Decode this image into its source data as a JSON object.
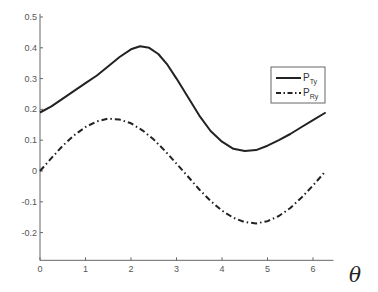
{
  "chart_data": {
    "type": "line",
    "title": "",
    "xlabel": "θ",
    "ylabel": "",
    "xlim": [
      0,
      6.45
    ],
    "ylim": [
      -0.29,
      0.51
    ],
    "xticks": [
      0,
      1,
      2,
      3,
      4,
      5,
      6
    ],
    "xtick_labels": [
      "0",
      "1",
      "2",
      "3",
      "4",
      "5",
      "6"
    ],
    "yticks": [
      0.5,
      0.4,
      0.3,
      0.2,
      0.1,
      0,
      -0.1,
      -0.2
    ],
    "ytick_labels": [
      "0.5",
      "0.4",
      "0.3",
      "0.2",
      "0.1",
      "0",
      "-0.1",
      "-0.2"
    ],
    "grid": false,
    "legend_position": "upper right",
    "series": [
      {
        "name": "P_Ty",
        "label_main": "P",
        "label_sub": "Ty",
        "style": "solid",
        "color": "#222222",
        "x": [
          0,
          0.25,
          0.5,
          0.75,
          1.0,
          1.25,
          1.5,
          1.75,
          2.0,
          2.2,
          2.4,
          2.6,
          2.8,
          3.0,
          3.25,
          3.5,
          3.75,
          4.0,
          4.25,
          4.5,
          4.75,
          5.0,
          5.25,
          5.5,
          5.75,
          6.0,
          6.28
        ],
        "values": [
          0.19,
          0.21,
          0.235,
          0.26,
          0.285,
          0.31,
          0.34,
          0.37,
          0.395,
          0.405,
          0.4,
          0.38,
          0.345,
          0.3,
          0.24,
          0.18,
          0.13,
          0.095,
          0.072,
          0.065,
          0.068,
          0.082,
          0.1,
          0.12,
          0.143,
          0.165,
          0.19
        ]
      },
      {
        "name": "P_Ry",
        "label_main": "P",
        "label_sub": "Ry",
        "style": "dashdot",
        "color": "#222222",
        "x": [
          0,
          0.25,
          0.5,
          0.75,
          1.0,
          1.25,
          1.5,
          1.75,
          2.0,
          2.25,
          2.5,
          2.75,
          3.0,
          3.25,
          3.5,
          3.75,
          4.0,
          4.25,
          4.5,
          4.75,
          5.0,
          5.25,
          5.5,
          5.75,
          6.0,
          6.28
        ],
        "values": [
          0.0,
          0.042,
          0.082,
          0.116,
          0.143,
          0.161,
          0.17,
          0.167,
          0.155,
          0.132,
          0.102,
          0.065,
          0.024,
          -0.018,
          -0.06,
          -0.097,
          -0.129,
          -0.152,
          -0.166,
          -0.17,
          -0.163,
          -0.146,
          -0.12,
          -0.086,
          -0.047,
          0.0
        ]
      }
    ]
  }
}
